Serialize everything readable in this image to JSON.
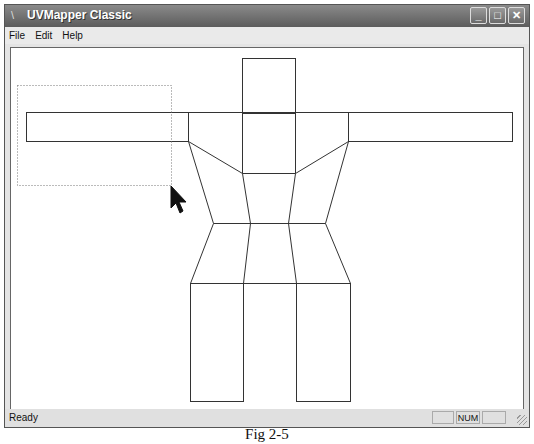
{
  "window": {
    "title": "UVMapper Classic",
    "controls": {
      "minimize": "_",
      "maximize": "□",
      "close": "✕"
    }
  },
  "menu": {
    "items": [
      "File",
      "Edit",
      "Help"
    ]
  },
  "status": {
    "text": "Ready",
    "panels": [
      "",
      "NUM",
      ""
    ]
  },
  "canvas": {
    "stroke_color": "#333333",
    "selection_rect": {
      "x": 15,
      "y": 83,
      "w": 154,
      "h": 100
    },
    "cursor": {
      "x": 169,
      "y": 184
    }
  },
  "caption": "Fig 2-5"
}
